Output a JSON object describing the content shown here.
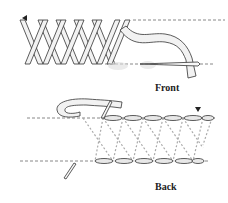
{
  "diagram": {
    "panels": [
      {
        "id": "front",
        "label": "Front"
      },
      {
        "id": "back",
        "label": "Back"
      }
    ]
  },
  "colors": {
    "line": "#333333",
    "dashed": "#888888",
    "thread_fill": "#f2f2f2"
  }
}
